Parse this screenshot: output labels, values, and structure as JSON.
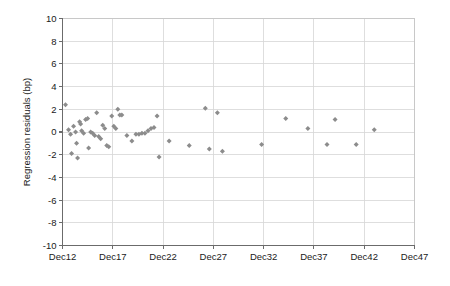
{
  "chart": {
    "type": "scatter",
    "ylabel": "Regression residuals (bp)",
    "xlabel": "",
    "title": "",
    "marker_color": "#8c8c8c",
    "marker_shape": "diamond",
    "grid": "both",
    "legend": "none"
  },
  "axes": {
    "y_ticks": [
      "10",
      "8",
      "6",
      "4",
      "2",
      "0",
      "-2",
      "-4",
      "-6",
      "-8",
      "-10"
    ],
    "y_values": [
      10,
      8,
      6,
      4,
      2,
      0,
      -2,
      -4,
      -6,
      -8,
      -10
    ],
    "y_min": -10,
    "y_max": 10,
    "x_ticks": [
      "Dec12",
      "Dec17",
      "Dec22",
      "Dec27",
      "Dec32",
      "Dec37",
      "Dec42",
      "Dec47"
    ],
    "x_tick_values": [
      12,
      17,
      22,
      27,
      32,
      37,
      42,
      47
    ],
    "x_min": 12,
    "x_max": 47
  },
  "chart_data": {
    "type": "scatter",
    "title": "",
    "xlabel": "",
    "ylabel": "Regression residuals (bp)",
    "xlim": [
      12,
      47
    ],
    "ylim": [
      -10,
      10
    ],
    "grid": true,
    "legend_position": "none",
    "categories": [
      "Dec12",
      "Dec17",
      "Dec22",
      "Dec27",
      "Dec32",
      "Dec37",
      "Dec42",
      "Dec47"
    ],
    "series": [
      {
        "name": "Regression residuals",
        "color": "#8c8c8c",
        "points": [
          {
            "x": 12.3,
            "y": 2.4
          },
          {
            "x": 12.6,
            "y": 0.2
          },
          {
            "x": 12.8,
            "y": -0.2
          },
          {
            "x": 12.9,
            "y": -1.9
          },
          {
            "x": 13.1,
            "y": 0.5
          },
          {
            "x": 13.3,
            "y": 0.0
          },
          {
            "x": 13.4,
            "y": -1.0
          },
          {
            "x": 13.5,
            "y": -2.3
          },
          {
            "x": 13.7,
            "y": 0.9
          },
          {
            "x": 13.8,
            "y": 0.7
          },
          {
            "x": 13.9,
            "y": 0.1
          },
          {
            "x": 14.1,
            "y": -0.1
          },
          {
            "x": 14.3,
            "y": 1.1
          },
          {
            "x": 14.5,
            "y": 1.2
          },
          {
            "x": 14.6,
            "y": -1.4
          },
          {
            "x": 14.8,
            "y": 0.0
          },
          {
            "x": 15.0,
            "y": -0.1
          },
          {
            "x": 15.2,
            "y": -0.3
          },
          {
            "x": 15.4,
            "y": 1.7
          },
          {
            "x": 15.6,
            "y": -0.4
          },
          {
            "x": 15.8,
            "y": -0.6
          },
          {
            "x": 16.0,
            "y": 0.6
          },
          {
            "x": 16.2,
            "y": 0.3
          },
          {
            "x": 16.4,
            "y": -1.2
          },
          {
            "x": 16.6,
            "y": -1.3
          },
          {
            "x": 16.9,
            "y": 1.4
          },
          {
            "x": 17.1,
            "y": 0.5
          },
          {
            "x": 17.3,
            "y": 0.3
          },
          {
            "x": 17.5,
            "y": 2.0
          },
          {
            "x": 17.7,
            "y": 1.5
          },
          {
            "x": 17.9,
            "y": 1.5
          },
          {
            "x": 18.4,
            "y": -0.3
          },
          {
            "x": 18.9,
            "y": -0.8
          },
          {
            "x": 19.3,
            "y": -0.2
          },
          {
            "x": 19.6,
            "y": -0.2
          },
          {
            "x": 19.9,
            "y": -0.1
          },
          {
            "x": 20.2,
            "y": -0.1
          },
          {
            "x": 20.5,
            "y": 0.1
          },
          {
            "x": 20.8,
            "y": 0.3
          },
          {
            "x": 21.1,
            "y": 0.4
          },
          {
            "x": 21.4,
            "y": 1.4
          },
          {
            "x": 21.6,
            "y": -2.2
          },
          {
            "x": 22.6,
            "y": -0.8
          },
          {
            "x": 24.6,
            "y": -1.2
          },
          {
            "x": 26.2,
            "y": 2.1
          },
          {
            "x": 26.6,
            "y": -1.5
          },
          {
            "x": 27.4,
            "y": 1.7
          },
          {
            "x": 27.9,
            "y": -1.7
          },
          {
            "x": 31.8,
            "y": -1.1
          },
          {
            "x": 34.2,
            "y": 1.2
          },
          {
            "x": 36.4,
            "y": 0.3
          },
          {
            "x": 38.3,
            "y": -1.1
          },
          {
            "x": 39.1,
            "y": 1.1
          },
          {
            "x": 41.2,
            "y": -1.1
          },
          {
            "x": 43.0,
            "y": 0.2
          }
        ]
      }
    ]
  }
}
